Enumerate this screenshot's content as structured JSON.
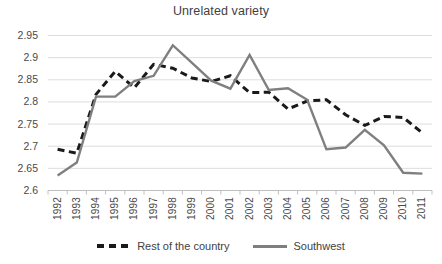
{
  "chart_data": {
    "type": "line",
    "title": "Unrelated variety",
    "xlabel": "",
    "ylabel": "",
    "ylim": [
      2.6,
      2.95
    ],
    "grid": true,
    "legend_position": "bottom",
    "categories": [
      "1992",
      "1993",
      "1994",
      "1995",
      "1996",
      "1997",
      "1998",
      "1999",
      "2000",
      "2001",
      "2002",
      "2003",
      "2004",
      "2005",
      "2006",
      "2007",
      "2008",
      "2009",
      "2010",
      "2011"
    ],
    "yticks": [
      "2.6",
      "2.65",
      "2.7",
      "2.75",
      "2.8",
      "2.85",
      "2.9",
      "2.95"
    ],
    "series": [
      {
        "name": "Rest of the country",
        "style": "dashed",
        "color": "#1a1a1a",
        "values": [
          2.693,
          2.684,
          2.817,
          2.869,
          2.832,
          2.885,
          2.876,
          2.854,
          2.846,
          2.859,
          2.821,
          2.822,
          2.784,
          2.802,
          2.805,
          2.771,
          2.747,
          2.767,
          2.765,
          2.73
        ]
      },
      {
        "name": "Southwest",
        "style": "solid",
        "color": "#7f7f7f",
        "values": [
          2.634,
          2.663,
          2.812,
          2.812,
          2.847,
          2.859,
          2.928,
          2.888,
          2.848,
          2.83,
          2.906,
          2.827,
          2.831,
          2.805,
          2.693,
          2.697,
          2.737,
          2.702,
          2.64,
          2.638
        ]
      }
    ]
  },
  "legend": {
    "entries": [
      {
        "label": "Rest of the country",
        "marker": "dashed-line-swatch"
      },
      {
        "label": "Southwest",
        "marker": "solid-line-swatch"
      }
    ]
  }
}
